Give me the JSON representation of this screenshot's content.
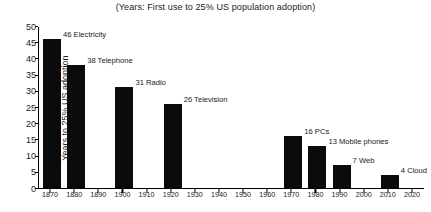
{
  "chart_data": {
    "type": "bar",
    "title": "(Years: First use to 25% US population adoption)",
    "xlabel": "",
    "ylabel": "Years to 25% US adoption",
    "ylim": [
      0,
      50
    ],
    "xlim": [
      1865,
      2025
    ],
    "grid": false,
    "legend": "none",
    "ytick_labels": [
      "0",
      "5",
      "10",
      "15",
      "20",
      "25",
      "30",
      "35",
      "40",
      "45",
      "50"
    ],
    "ytick_values": [
      0,
      5,
      10,
      15,
      20,
      25,
      30,
      35,
      40,
      45,
      50
    ],
    "xtick_labels": [
      "1870",
      "1880",
      "1890",
      "1900",
      "1910",
      "1920",
      "1930",
      "1940",
      "1950",
      "1960",
      "1970",
      "1980",
      "1990",
      "2000",
      "2010",
      "2020"
    ],
    "xtick_values": [
      1870,
      1880,
      1890,
      1900,
      1910,
      1920,
      1930,
      1940,
      1950,
      1960,
      1970,
      1980,
      1990,
      2000,
      2010,
      2020
    ],
    "bar_color": "#0b0b0b",
    "categories": [
      "Electricity",
      "Telephone",
      "Radio",
      "Television",
      "PCs",
      "Mobile phones",
      "Web",
      "Cloud"
    ],
    "values": [
      46,
      38,
      31,
      26,
      16,
      13,
      7,
      4
    ],
    "x": [
      1870,
      1880,
      1900,
      1920,
      1970,
      1980,
      1990,
      2010
    ],
    "bars": [
      {
        "name": "Electricity",
        "year": 1870,
        "value": 46,
        "label": "46 Electricity"
      },
      {
        "name": "Telephone",
        "year": 1880,
        "value": 38,
        "label": "38 Telephone"
      },
      {
        "name": "Radio",
        "year": 1900,
        "value": 31,
        "label": "31 Radio"
      },
      {
        "name": "Television",
        "year": 1920,
        "value": 26,
        "label": "26 Television"
      },
      {
        "name": "PCs",
        "year": 1970,
        "value": 16,
        "label": "16 PCs"
      },
      {
        "name": "Mobile phones",
        "year": 1980,
        "value": 13,
        "label": "13 Mobile phones"
      },
      {
        "name": "Web",
        "year": 1990,
        "value": 7,
        "label": "7 Web"
      },
      {
        "name": "Cloud",
        "year": 2010,
        "value": 4,
        "label": "4 Cloud"
      }
    ]
  }
}
